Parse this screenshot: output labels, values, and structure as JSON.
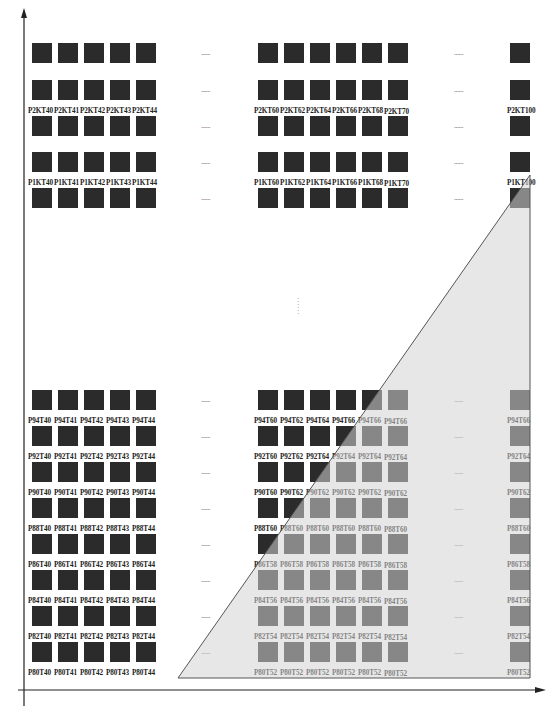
{
  "diagram": {
    "type": "die-grid-with-triangular-region",
    "axes": {
      "x_arrow": true,
      "y_arrow": true
    },
    "colors": {
      "die": "#2b2b2b",
      "region_fill": "#d9d9d9",
      "region_stroke": "#555555",
      "axis": "#222222"
    },
    "ellipsis": "......",
    "top_rows": [
      {
        "id": "r0",
        "labels": null
      },
      {
        "id": "P2K",
        "labels": {
          "left": [
            "P2KT40",
            "P2KT41",
            "P2KT42",
            "P2KT43",
            "P2KT44"
          ],
          "mid": [
            "P2KT60",
            "P2KT62",
            "P2KT64",
            "P2KT66",
            "P2KT68",
            "P2KT70"
          ],
          "right": "P2KT100"
        }
      },
      {
        "id": "r2",
        "labels": null
      },
      {
        "id": "P1K",
        "labels": {
          "left": [
            "P1KT40",
            "P1KT41",
            "P1KT42",
            "P1KT43",
            "P1KT44"
          ],
          "mid": [
            "P1KT60",
            "P1KT62",
            "P1KT64",
            "P1KT66",
            "P1KT68",
            "P1KT70"
          ],
          "right": "P1KT100"
        }
      },
      {
        "id": "r4",
        "labels": null
      }
    ],
    "bottom_rows": [
      {
        "left": [
          "P94T40",
          "P94T41",
          "P94T42",
          "P94T43",
          "P94T44"
        ],
        "mid": [
          "P94T60",
          "P94T62",
          "P94T64",
          "P94T66",
          "P94T66",
          "P94T66"
        ],
        "right": "P94T66"
      },
      {
        "left": [
          "P92T40",
          "P92T41",
          "P92T42",
          "P92T43",
          "P92T44"
        ],
        "mid": [
          "P92T60",
          "P92T62",
          "P92T64",
          "P92T64",
          "P92T64",
          "P92T64"
        ],
        "right": "P92T64"
      },
      {
        "left": [
          "P90T40",
          "P90T41",
          "P90T42",
          "P90T43",
          "P90T44"
        ],
        "mid": [
          "P90T60",
          "P90T62",
          "P90T62",
          "P90T62",
          "P90T62",
          "P90T62"
        ],
        "right": "P90T62"
      },
      {
        "left": [
          "P88T40",
          "P88T41",
          "P88T42",
          "P88T43",
          "P88T44"
        ],
        "mid": [
          "P88T60",
          "P88T60",
          "P88T60",
          "P88T60",
          "P88T60",
          "P88T60"
        ],
        "right": "P88T60"
      },
      {
        "left": [
          "P86T40",
          "P86T41",
          "P86T42",
          "P86T43",
          "P86T44"
        ],
        "mid": [
          "P86T58",
          "P86T58",
          "P86T58",
          "P86T58",
          "P86T58",
          "P86T58"
        ],
        "right": "P86T58"
      },
      {
        "left": [
          "P84T40",
          "P84T41",
          "P84T42",
          "P84T43",
          "P84T44"
        ],
        "mid": [
          "P84T56",
          "P84T56",
          "P84T56",
          "P84T56",
          "P84T56",
          "P84T56"
        ],
        "right": "P84T56"
      },
      {
        "left": [
          "P82T40",
          "P82T41",
          "P82T42",
          "P82T43",
          "P82T44"
        ],
        "mid": [
          "P82T54",
          "P82T54",
          "P82T54",
          "P82T54",
          "P82T54",
          "P82T54"
        ],
        "right": "P82T54"
      },
      {
        "left": [
          "P80T40",
          "P80T41",
          "P80T42",
          "P80T43",
          "P80T44"
        ],
        "mid": [
          "P80T52",
          "P80T52",
          "P80T52",
          "P80T52",
          "P80T52",
          "P80T52"
        ],
        "right": "P80T52"
      }
    ]
  }
}
